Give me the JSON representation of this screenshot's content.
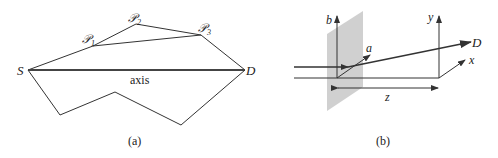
{
  "figure_a": {
    "caption": "(a)",
    "labels": {
      "S": "S",
      "D": "D",
      "P1": "𝒫",
      "P1_sub": "1",
      "P2": "𝒫",
      "P2_sub": "2",
      "P3": "𝒫",
      "P3_sub": "3",
      "axis": "axis"
    }
  },
  "figure_b": {
    "caption": "(b)",
    "labels": {
      "b": "b",
      "a": "a",
      "y": "y",
      "x": "x",
      "D": "D",
      "z": "z"
    }
  },
  "colors": {
    "line": "#333333",
    "plane": "#c8c8c8"
  }
}
